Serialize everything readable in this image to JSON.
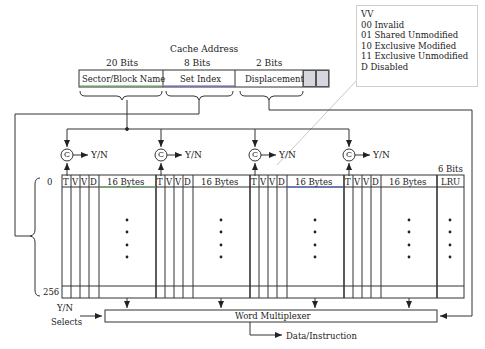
{
  "address": {
    "title": "Cache Address",
    "fields": [
      {
        "bits": "20 Bits",
        "label": "Sector/Block Name"
      },
      {
        "bits": "8 Bits",
        "label": "Set Index"
      },
      {
        "bits": "2 Bits",
        "label": "Displacement"
      }
    ]
  },
  "legend": {
    "lines": [
      "VV",
      "00 Invalid",
      "01 Shared Unmodified",
      "10 Exclusive Modified",
      "11 Exclusive Unmodified",
      "D Disabled"
    ]
  },
  "comparators": {
    "symbol": "C",
    "output": "Y/N"
  },
  "table": {
    "row_start": "0",
    "row_end": "256",
    "lru_bits": "6 Bits",
    "way_columns": [
      "T",
      "V",
      "V",
      "D",
      "16 Bytes"
    ],
    "lru_label": "LRU"
  },
  "multiplexer": {
    "label": "Word Multiplexer",
    "input_label_1": "Y/N",
    "input_label_2": "Selects",
    "output_label": "Data/Instruction"
  }
}
